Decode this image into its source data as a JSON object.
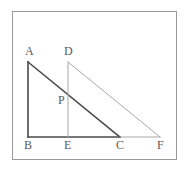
{
  "figure": {
    "border": {
      "color": "#9a9a9a",
      "x": 12,
      "y": 11,
      "width": 164,
      "height": 148
    },
    "colors": {
      "dark_stroke": "#4a4a4a",
      "light_stroke": "#a8a8a8",
      "label_text": "#5a5a5a",
      "background": "#ffffff"
    },
    "points": [
      {
        "name": "A",
        "x": 28,
        "y": 62,
        "label_x": 25,
        "label_y": 45
      },
      {
        "name": "D",
        "x": 68,
        "y": 62,
        "label_x": 64,
        "label_y": 45
      },
      {
        "name": "P",
        "x": 68,
        "y": 100,
        "label_x": 58,
        "label_y": 94
      },
      {
        "name": "B",
        "x": 28,
        "y": 137,
        "label_x": 24,
        "label_y": 139
      },
      {
        "name": "E",
        "x": 68,
        "y": 137,
        "label_x": 64,
        "label_y": 139
      },
      {
        "name": "C",
        "x": 120,
        "y": 137,
        "label_x": 116,
        "label_y": 139
      },
      {
        "name": "F",
        "x": 160,
        "y": 137,
        "label_x": 157,
        "label_y": 139
      }
    ],
    "segments": [
      {
        "name": "segment-AB",
        "from": "A",
        "to": "B",
        "weight": "dark",
        "width": 1.6
      },
      {
        "name": "segment-AC",
        "from": "A",
        "to": "C",
        "weight": "dark",
        "width": 1.6
      },
      {
        "name": "segment-BC",
        "from": "B",
        "to": "C",
        "weight": "dark",
        "width": 1.4
      },
      {
        "name": "segment-CF",
        "from": "C",
        "to": "F",
        "weight": "light",
        "width": 1.0
      },
      {
        "name": "segment-DE",
        "from": "D",
        "to": "E",
        "weight": "light",
        "width": 1.0
      },
      {
        "name": "segment-DF",
        "from": "D",
        "to": "F",
        "weight": "light",
        "width": 1.0
      }
    ]
  }
}
